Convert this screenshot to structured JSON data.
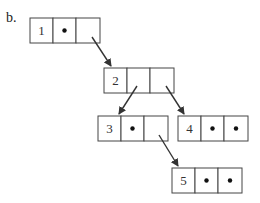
{
  "label": "b.",
  "nodes": [
    {
      "id": "1",
      "value": "1",
      "x": 30,
      "y": 18,
      "left": "empty-dot",
      "right": "pointer"
    },
    {
      "id": "2",
      "value": "2",
      "x": 104,
      "y": 68,
      "left": "pointer",
      "right": "pointer"
    },
    {
      "id": "3",
      "value": "3",
      "x": 98,
      "y": 116,
      "left": "dot",
      "right": "pointer"
    },
    {
      "id": "4",
      "value": "4",
      "x": 178,
      "y": 116,
      "left": "dot",
      "right": "dot"
    },
    {
      "id": "5",
      "value": "5",
      "x": 172,
      "y": 168,
      "left": "dot",
      "right": "dot"
    }
  ],
  "edges": [
    {
      "from": "1",
      "to": "2"
    },
    {
      "from": "2",
      "to": "3"
    },
    {
      "from": "2",
      "to": "4"
    },
    {
      "from": "3",
      "to": "5"
    }
  ],
  "colors": {
    "stroke": "#444444",
    "dot": "#111111",
    "background": "#ffffff"
  }
}
